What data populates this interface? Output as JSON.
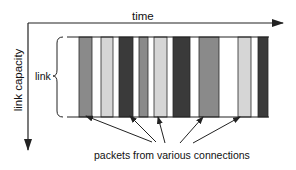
{
  "diagram": {
    "x_axis_label": "time",
    "y_axis_label": "link capacity",
    "link_label": "link",
    "caption": "packets from various connections",
    "colors": {
      "medium": "#8a8a8a",
      "light": "#d6d6d6",
      "dark": "#3a3a3a",
      "border": "#2a2a2a",
      "axis": "#222222"
    },
    "packets": [
      {
        "x": 79,
        "w": 13,
        "shade": "medium"
      },
      {
        "x": 101,
        "w": 12,
        "shade": "light"
      },
      {
        "x": 119,
        "w": 14,
        "shade": "dark"
      },
      {
        "x": 139,
        "w": 9,
        "shade": "medium"
      },
      {
        "x": 154,
        "w": 13,
        "shade": "light"
      },
      {
        "x": 173,
        "w": 17,
        "shade": "dark"
      },
      {
        "x": 199,
        "w": 20,
        "shade": "medium"
      },
      {
        "x": 238,
        "w": 13,
        "shade": "light"
      },
      {
        "x": 258,
        "w": 10,
        "shade": "dark"
      }
    ],
    "pointers": [
      {
        "from": [
          152,
          142
        ],
        "to": [
          86,
          116
        ]
      },
      {
        "from": [
          156,
          142
        ],
        "to": [
          130,
          116
        ]
      },
      {
        "from": [
          165,
          143
        ],
        "to": [
          158,
          117
        ]
      },
      {
        "from": [
          180,
          143
        ],
        "to": [
          203,
          117
        ]
      },
      {
        "from": [
          193,
          143
        ],
        "to": [
          240,
          117
        ]
      }
    ]
  }
}
